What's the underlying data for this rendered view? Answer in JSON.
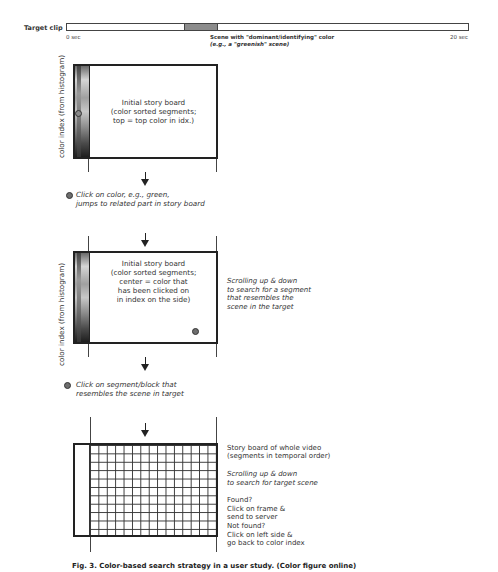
{
  "target_clip": {
    "label": "Target clip",
    "start_label": "0 sec",
    "end_label": "20 sec",
    "scene_note_line1": "Scene with \"dominant/identifying\" color",
    "scene_note_line2": "(e.g., a \"greenish\" scene)",
    "scene_color": "#8c8c8c"
  },
  "axis_label": "color index (from histogram)",
  "step1": {
    "board_text": "Initial story board\n(color sorted segments;\ntop = top color in idx.)"
  },
  "action1": {
    "text": "Click on color, e.g., green,\njumps to related part in story board"
  },
  "step2": {
    "board_text": "Initial story board\n(color sorted segments;\ncenter = color that\nhas been clicked on\nin index on the side)",
    "side_note": "Scrolling up & down\nto search for a segment\nthat resembles the\nscene in the target"
  },
  "action2": {
    "text": "Click on segment/block that\nresembles the scene in target"
  },
  "step3": {
    "side_line1": "Story board of whole video\n(segments in temporal order)",
    "side_line2": "Scrolling up & down\nto search for target scene",
    "side_line3": "Found?\n  Click on frame &\n  send to server\nNot found?\n  Click on left side &\n  go back to color index",
    "grid_cols": 15,
    "grid_rows": 11
  },
  "caption": "Fig. 3.  Color-based search strategy in a user study. (Color figure online)",
  "colors": {
    "dot": "#6e6e6e",
    "border": "#222222"
  }
}
